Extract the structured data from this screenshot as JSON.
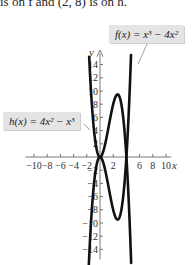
{
  "caption": "is on f and (2, 8) is on h.",
  "chart_data": {
    "type": "line",
    "title": "",
    "xlabel": "x",
    "ylabel": "y",
    "xlim": [
      -11,
      11
    ],
    "ylim": [
      -15,
      15
    ],
    "x_ticks": [
      -10,
      -8,
      -6,
      -4,
      -2,
      2,
      6,
      8,
      10
    ],
    "y_ticks": [
      14,
      12,
      10,
      8,
      6,
      4,
      2,
      -2,
      -4,
      -6,
      -8,
      -10,
      -12,
      -14
    ],
    "x_tick_labels": [
      "−10",
      "−8",
      "−6",
      "−4",
      "−2",
      "2",
      "6",
      "8",
      "10"
    ],
    "y_tick_labels": [
      "14",
      "12",
      "10",
      "8",
      "6",
      "4",
      "2",
      "−2",
      "−4",
      "−6",
      "−8",
      "−10",
      "−12",
      "−14"
    ],
    "series": [
      {
        "name": "f(x) = x^3 − 4x^2",
        "label": "f(x) = x³ − 4x²",
        "x": [
          -1.6,
          -1,
          0,
          1,
          2,
          2.67,
          3,
          4,
          4.5,
          5,
          5.2
        ],
        "values": [
          -13.8,
          -5,
          0,
          -3,
          -8,
          -9.48,
          -9,
          0,
          10.1,
          25,
          32.5
        ]
      },
      {
        "name": "h(x) = 4x^2 − x^3",
        "label": "h(x) = 4x² − x³",
        "x": [
          -1.6,
          -1,
          0,
          1,
          2,
          2.67,
          3,
          4,
          4.5,
          5,
          5.2
        ],
        "values": [
          13.8,
          5,
          0,
          3,
          8,
          9.48,
          9,
          0,
          -10.1,
          -25,
          -32.5
        ]
      }
    ],
    "annotations": [
      "f(x) = x³ − 4x²",
      "h(x) = 4x² − x³"
    ],
    "grid": false,
    "legend": "callout labels"
  },
  "labels": {
    "f": "f(x) = x³ − 4x²",
    "h": "h(x) = 4x² − x³"
  },
  "axis": {
    "x_name": "x",
    "y_name": "y"
  }
}
